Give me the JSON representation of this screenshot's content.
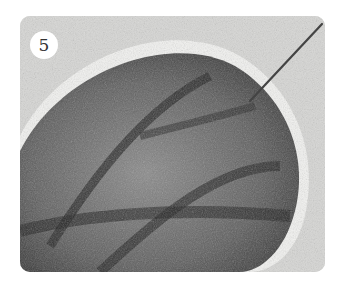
{
  "figure": {
    "step_number": "5",
    "photo_description": "Close-up of a needle-felted gray wool leaf shape on a white felt background, with a felting needle inserted at the upper right",
    "colors": {
      "background": "#d9d9d7",
      "wool_dark": "#2a2a2a",
      "wool_mid": "#6e6e6e",
      "badge_bg": "#ffffff",
      "badge_text": "#333333"
    }
  }
}
